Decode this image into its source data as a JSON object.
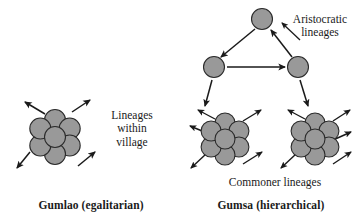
{
  "figure": {
    "background": "#ffffff",
    "node_fill": "#999999",
    "node_stroke": "#2b2b2b",
    "line_color": "#1a1a1a"
  },
  "left_panel": {
    "caption": "Gumlao (egalitarian)",
    "annotation": "Lineages\nwithin\nvillage",
    "annotation_lines": [
      "Lineages",
      "within",
      "village"
    ],
    "cluster": {
      "name": "village-lineage-ring",
      "node_count": 7,
      "center": [
        55,
        137
      ],
      "ring_radius": 17,
      "node_radius": 10.5,
      "nodes": [
        [
          55,
          120
        ],
        [
          69.7,
          128.5
        ],
        [
          69.7,
          145.5
        ],
        [
          55,
          154
        ],
        [
          40.3,
          145.5
        ],
        [
          40.3,
          128.5
        ],
        [
          55,
          137
        ]
      ]
    },
    "outward_arrows": [
      {
        "name": "arrow-upper-left",
        "from": [
          45,
          114
        ],
        "to": [
          25,
          102
        ]
      },
      {
        "name": "arrow-upper-right",
        "from": [
          72,
          112
        ],
        "to": [
          90,
          100
        ]
      },
      {
        "name": "arrow-lower-left",
        "from": [
          30,
          152
        ],
        "to": [
          17,
          168
        ]
      },
      {
        "name": "arrow-lower-right",
        "from": [
          78,
          166
        ],
        "to": [
          95,
          152
        ]
      }
    ]
  },
  "right_panel": {
    "caption": "Gumsa (hierarchical)",
    "aristocratic_label": "Aristocratic\nlineages",
    "aristocratic_label_lines": [
      "Aristocratic",
      "lineages"
    ],
    "commoner_label": "Commoner lineages",
    "aristocratic_nodes": [
      {
        "name": "aristocratic-node-top",
        "cx": 262,
        "cy": 19,
        "r": 10.5
      },
      {
        "name": "aristocratic-node-left",
        "cx": 214,
        "cy": 67,
        "r": 10.5
      },
      {
        "name": "aristocratic-node-right",
        "cx": 298,
        "cy": 67,
        "r": 10.5
      }
    ],
    "aristocratic_arrows": [
      {
        "name": "arrow-top-to-left",
        "from": [
          255,
          29
        ],
        "to": [
          221,
          57
        ]
      },
      {
        "name": "arrow-left-to-right",
        "from": [
          227,
          67
        ],
        "to": [
          285,
          67
        ]
      },
      {
        "name": "arrow-right-to-top",
        "from": [
          292,
          57
        ],
        "to": [
          271,
          30
        ]
      }
    ],
    "pointer_to_aristocratic_label": {
      "name": "arrow-to-aristocratic-label",
      "from": [
        300,
        40
      ],
      "to": [
        282,
        23
      ]
    },
    "descent_arrows": [
      {
        "name": "arrow-left-descent",
        "from": [
          212,
          80
        ],
        "to": [
          205,
          106
        ]
      },
      {
        "name": "arrow-right-descent",
        "from": [
          300,
          80
        ],
        "to": [
          308,
          106
        ]
      }
    ],
    "commoner_clusters": [
      {
        "name": "commoner-lineage-ring-left",
        "node_count": 7,
        "center": [
          225,
          139
        ],
        "ring_radius": 16,
        "node_radius": 10,
        "nodes": [
          [
            225,
            123
          ],
          [
            238.9,
            131
          ],
          [
            238.9,
            147
          ],
          [
            225,
            155
          ],
          [
            211.1,
            147
          ],
          [
            211.1,
            131
          ],
          [
            225,
            139
          ]
        ],
        "arrows": [
          {
            "name": "arrow-ul",
            "from": [
              215,
              119
            ],
            "to": [
              198,
              110
            ]
          },
          {
            "name": "arrow-ur",
            "from": [
              243,
              121
            ],
            "to": [
              261,
              110
            ]
          },
          {
            "name": "arrow-l",
            "from": [
              207,
              133
            ],
            "to": [
              190,
              126
            ]
          },
          {
            "name": "arrow-ll",
            "from": [
              206,
              154
            ],
            "to": [
              191,
              168
            ]
          },
          {
            "name": "arrow-lr",
            "from": [
              243,
              164
            ],
            "to": [
              262,
              152
            ]
          }
        ]
      },
      {
        "name": "commoner-lineage-ring-right",
        "node_count": 7,
        "center": [
          315,
          139
        ],
        "ring_radius": 16,
        "node_radius": 10,
        "nodes": [
          [
            315,
            123
          ],
          [
            328.9,
            131
          ],
          [
            328.9,
            147
          ],
          [
            315,
            155
          ],
          [
            301.1,
            147
          ],
          [
            301.1,
            131
          ],
          [
            315,
            139
          ]
        ],
        "arrows": [
          {
            "name": "arrow-ul",
            "from": [
              305,
              119
            ],
            "to": [
              288,
              110
            ]
          },
          {
            "name": "arrow-ur",
            "from": [
              333,
              121
            ],
            "to": [
              350,
              110
            ]
          },
          {
            "name": "arrow-r",
            "from": [
              333,
              140
            ],
            "to": [
              351,
              132
            ]
          },
          {
            "name": "arrow-ll",
            "from": [
              296,
              154
            ],
            "to": [
              281,
              168
            ]
          },
          {
            "name": "arrow-lr",
            "from": [
              333,
              164
            ],
            "to": [
              351,
              152
            ]
          }
        ]
      }
    ]
  }
}
